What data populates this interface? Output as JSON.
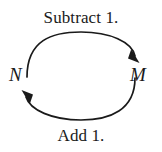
{
  "diagram": {
    "type": "cycle-diagram",
    "background_color": "#ffffff",
    "stroke_color": "#1a1a1a",
    "nodes": [
      {
        "id": "n",
        "label": "N",
        "position": "left"
      },
      {
        "id": "m",
        "label": "M",
        "position": "right"
      }
    ],
    "edges": [
      {
        "id": "top",
        "label": "Subtract 1.",
        "from": "N",
        "to": "M",
        "direction": "clockwise",
        "arrowhead": "solid-triangle",
        "position": "top"
      },
      {
        "id": "bottom",
        "label": "Add 1.",
        "from": "M",
        "to": "N",
        "direction": "clockwise",
        "arrowhead": "solid-triangle",
        "position": "bottom"
      }
    ]
  }
}
